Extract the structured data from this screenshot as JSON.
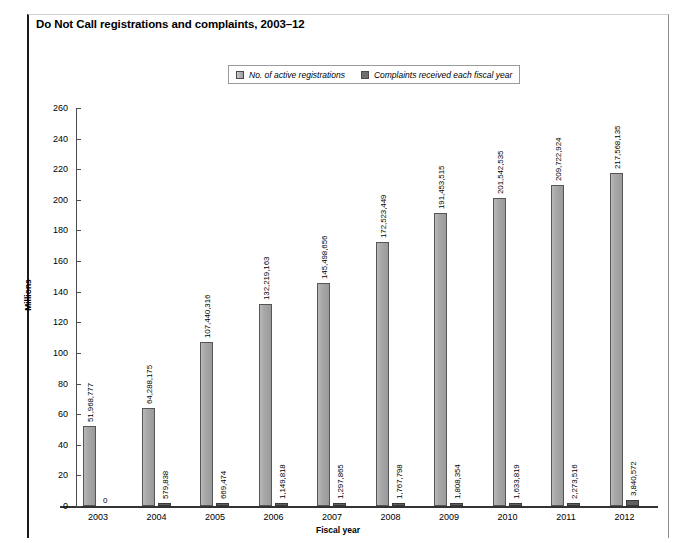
{
  "title": "Do Not Call registrations and complaints, 2003–12",
  "legend": {
    "position": "top-center",
    "items": [
      {
        "label": "No. of active registrations",
        "swatch": "light-gray",
        "color": "#a8a8a8"
      },
      {
        "label": "Complaints received each fiscal year",
        "swatch": "dark-gray",
        "color": "#5f5f5f"
      }
    ]
  },
  "chart_data": {
    "type": "bar",
    "title": "Do Not Call registrations and complaints, 2003–12",
    "xlabel": "Fiscal year",
    "ylabel": "Millions",
    "categories": [
      "2003",
      "2004",
      "2005",
      "2006",
      "2007",
      "2008",
      "2009",
      "2010",
      "2011",
      "2012"
    ],
    "ylim": [
      0,
      260
    ],
    "yticks": [
      0,
      20,
      40,
      60,
      80,
      100,
      120,
      140,
      160,
      180,
      200,
      220,
      240,
      260
    ],
    "ytick_labels": [
      "0",
      "20",
      "40",
      "60",
      "80",
      "100",
      "120",
      "140",
      "160",
      "180",
      "200",
      "220",
      "240",
      "260"
    ],
    "grid": false,
    "units": "Millions",
    "series": [
      {
        "name": "No. of active registrations",
        "color": "#a8a8a8",
        "values": [
          51968777,
          64288175,
          107440316,
          132219163,
          145498656,
          172523449,
          191453515,
          201542535,
          209722924,
          217568135
        ],
        "labels": [
          "51,968,777",
          "64,288,175",
          "107,440,316",
          "132,219,163",
          "145,498,656",
          "172,523,449",
          "191,453,515",
          "201,542,535",
          "209,722,924",
          "217,568,135"
        ]
      },
      {
        "name": "Complaints received each fiscal year",
        "color": "#5f5f5f",
        "values": [
          0,
          579838,
          669474,
          1149818,
          1297865,
          1767798,
          1808354,
          1633819,
          2273516,
          3840572
        ],
        "labels": [
          "0",
          "579,838",
          "669,474",
          "1,149,818",
          "1,297,865",
          "1,767,798",
          "1,808,354",
          "1,633,819",
          "2,273,516",
          "3,840,572"
        ]
      }
    ]
  }
}
